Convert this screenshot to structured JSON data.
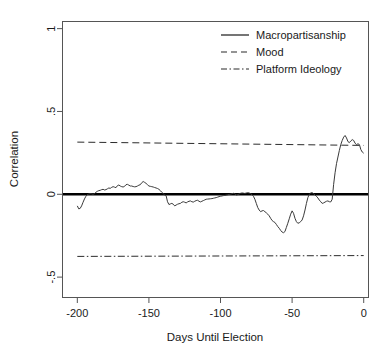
{
  "chart_data": {
    "type": "line",
    "title": "",
    "xlabel": "Days Until Election",
    "ylabel": "Correlation",
    "xlim": [
      -210,
      3
    ],
    "ylim": [
      -0.62,
      1.04
    ],
    "grid": false,
    "legend_position": "top-right",
    "xticks": [
      -200,
      -150,
      -100,
      -50,
      0
    ],
    "xticklabels": [
      "-200",
      "-150",
      "-100",
      "-50",
      "0"
    ],
    "yticks": [
      1,
      0.5,
      0,
      -0.5
    ],
    "yticklabels": [
      "1",
      ".5",
      "0",
      "-.5"
    ],
    "zero_reference_line": {
      "name": "zero-line",
      "y": 0,
      "style": "solid-thick"
    },
    "series": [
      {
        "name": "Macropartisanship",
        "style": "solid",
        "x": [
          -200,
          -198,
          -196,
          -194,
          -192,
          -190,
          -188,
          -186,
          -184,
          -182,
          -180,
          -178,
          -176,
          -174,
          -172,
          -170,
          -168,
          -166,
          -164,
          -162,
          -160,
          -158,
          -156,
          -154,
          -152,
          -150,
          -148,
          -146,
          -144,
          -142,
          -140,
          -138,
          -136,
          -134,
          -132,
          -130,
          -128,
          -126,
          -124,
          -122,
          -120,
          -118,
          -116,
          -114,
          -112,
          -110,
          -108,
          -106,
          -104,
          -102,
          -100,
          -98,
          -96,
          -94,
          -92,
          -90,
          -88,
          -86,
          -84,
          -82,
          -80,
          -78,
          -76,
          -74,
          -72,
          -70,
          -68,
          -66,
          -64,
          -62,
          -60,
          -58,
          -56,
          -54,
          -52,
          -50,
          -48,
          -46,
          -44,
          -42,
          -40,
          -38,
          -36,
          -34,
          -32,
          -30,
          -28,
          -26,
          -24,
          -22,
          -20,
          -18,
          -16,
          -14,
          -12,
          -10,
          -8,
          -6,
          -4,
          -2,
          0
        ],
        "y": [
          -0.075,
          -0.085,
          -0.06,
          -0.025,
          0.0,
          0.005,
          0.0,
          0.01,
          0.02,
          0.03,
          0.028,
          0.035,
          0.045,
          0.04,
          0.055,
          0.05,
          0.045,
          0.06,
          0.055,
          0.05,
          0.045,
          0.05,
          0.055,
          0.075,
          0.07,
          0.05,
          0.045,
          0.04,
          0.035,
          0.02,
          0.005,
          -0.005,
          -0.06,
          -0.055,
          -0.07,
          -0.06,
          -0.055,
          -0.045,
          -0.05,
          -0.04,
          -0.045,
          -0.04,
          -0.035,
          -0.045,
          -0.04,
          -0.03,
          -0.028,
          -0.025,
          -0.02,
          -0.015,
          -0.01,
          -0.008,
          -0.003,
          0.0,
          0.005,
          -0.005,
          0.003,
          0.008,
          0.005,
          0.01,
          0.005,
          -0.005,
          -0.03,
          -0.09,
          -0.105,
          -0.1,
          -0.11,
          -0.12,
          -0.155,
          -0.165,
          -0.18,
          -0.2,
          -0.225,
          -0.23,
          -0.19,
          -0.145,
          -0.1,
          -0.16,
          -0.175,
          -0.16,
          -0.08,
          -0.02,
          0.01,
          0.0,
          -0.015,
          -0.04,
          -0.055,
          -0.05,
          -0.04,
          -0.045,
          0.12,
          0.21,
          0.31,
          0.355,
          0.315,
          0.33,
          0.3,
          0.305,
          0.265,
          0.255,
          0.23
        ]
      },
      {
        "name": "Mood",
        "style": "dashed",
        "x": [
          -200,
          0
        ],
        "y": [
          0.315,
          0.295
        ]
      },
      {
        "name": "Platform Ideology",
        "style": "dashdot",
        "x": [
          -200,
          0
        ],
        "y": [
          -0.375,
          -0.37
        ]
      }
    ],
    "macropartisanship_detail": {
      "x": [
        -200,
        -199,
        -198,
        -197,
        -196,
        -195,
        -194,
        -193,
        -192,
        -191,
        -190,
        -189,
        -188,
        -187,
        -186,
        -185,
        -184,
        -183,
        -182,
        -181,
        -180,
        -179,
        -178,
        -177,
        -176,
        -175,
        -174,
        -173,
        -172,
        -171,
        -170,
        -169,
        -168,
        -167,
        -166,
        -165,
        -164,
        -163,
        -162,
        -161,
        -160,
        -159,
        -158,
        -157,
        -156,
        -155,
        -154,
        -153,
        -152,
        -151,
        -150,
        -149,
        -148,
        -147,
        -146,
        -145,
        -144,
        -143,
        -142,
        -141,
        -140,
        -139,
        -138,
        -137,
        -136,
        -135,
        -134,
        -133,
        -132,
        -131,
        -130,
        -129,
        -128,
        -127,
        -126,
        -125,
        -124,
        -123,
        -122,
        -121,
        -120,
        -119,
        -118,
        -117,
        -116,
        -115,
        -114,
        -113,
        -112,
        -111,
        -110,
        -109,
        -108,
        -107,
        -106,
        -105,
        -104,
        -103,
        -102,
        -101,
        -100,
        -99,
        -98,
        -97,
        -96,
        -95,
        -94,
        -93,
        -92,
        -91,
        -90,
        -89,
        -88,
        -87,
        -86,
        -85,
        -84,
        -83,
        -82,
        -81,
        -80,
        -79,
        -78,
        -77,
        -76,
        -75,
        -74,
        -73,
        -72,
        -71,
        -70,
        -69,
        -68,
        -67,
        -66,
        -65,
        -64,
        -63,
        -62,
        -61,
        -60,
        -59,
        -58,
        -57,
        -56,
        -55,
        -54,
        -53,
        -52,
        -51,
        -50,
        -49,
        -48,
        -47,
        -46,
        -45,
        -44,
        -43,
        -42,
        -41,
        -40,
        -39,
        -38,
        -37,
        -36,
        -35,
        -34,
        -33,
        -32,
        -31,
        -30,
        -29,
        -28,
        -27,
        -26,
        -25,
        -24,
        -23,
        -22,
        -21,
        -20,
        -19,
        -18,
        -17,
        -16,
        -15,
        -14,
        -13,
        -12,
        -11,
        -10,
        -9,
        -8,
        -7,
        -6,
        -5,
        -4,
        -3,
        -2,
        -1,
        0
      ],
      "y": [
        -0.07,
        -0.088,
        -0.085,
        -0.07,
        -0.048,
        -0.028,
        -0.012,
        -0.002,
        0.002,
        0.004,
        0.003,
        0.0,
        0.004,
        0.012,
        0.018,
        0.022,
        0.024,
        0.028,
        0.03,
        0.026,
        0.028,
        0.033,
        0.038,
        0.036,
        0.042,
        0.046,
        0.043,
        0.04,
        0.052,
        0.056,
        0.05,
        0.046,
        0.044,
        0.048,
        0.058,
        0.06,
        0.055,
        0.05,
        0.05,
        0.047,
        0.045,
        0.046,
        0.05,
        0.055,
        0.058,
        0.07,
        0.077,
        0.072,
        0.066,
        0.058,
        0.05,
        0.048,
        0.046,
        0.044,
        0.041,
        0.038,
        0.035,
        0.03,
        0.022,
        0.012,
        0.004,
        -0.004,
        -0.008,
        -0.045,
        -0.062,
        -0.058,
        -0.055,
        -0.06,
        -0.07,
        -0.065,
        -0.06,
        -0.057,
        -0.055,
        -0.048,
        -0.045,
        -0.048,
        -0.052,
        -0.046,
        -0.042,
        -0.04,
        -0.045,
        -0.047,
        -0.042,
        -0.038,
        -0.036,
        -0.042,
        -0.046,
        -0.042,
        -0.038,
        -0.034,
        -0.03,
        -0.029,
        -0.028,
        -0.027,
        -0.026,
        -0.024,
        -0.022,
        -0.02,
        -0.017,
        -0.014,
        -0.012,
        -0.01,
        -0.008,
        -0.007,
        -0.005,
        -0.003,
        -0.001,
        0.001,
        0.004,
        0.006,
        0.003,
        -0.004,
        -0.002,
        0.002,
        0.006,
        0.008,
        0.007,
        0.005,
        0.008,
        0.01,
        0.008,
        0.004,
        -0.002,
        -0.012,
        -0.03,
        -0.055,
        -0.08,
        -0.095,
        -0.105,
        -0.1,
        -0.098,
        -0.105,
        -0.112,
        -0.12,
        -0.13,
        -0.145,
        -0.158,
        -0.165,
        -0.17,
        -0.182,
        -0.195,
        -0.205,
        -0.218,
        -0.228,
        -0.232,
        -0.225,
        -0.2,
        -0.175,
        -0.148,
        -0.12,
        -0.1,
        -0.115,
        -0.145,
        -0.165,
        -0.175,
        -0.172,
        -0.165,
        -0.155,
        -0.13,
        -0.095,
        -0.055,
        -0.02,
        0.0,
        0.008,
        0.01,
        0.004,
        -0.005,
        -0.012,
        -0.022,
        -0.035,
        -0.045,
        -0.055,
        -0.052,
        -0.047,
        -0.042,
        -0.04,
        -0.045,
        -0.046,
        -0.03,
        0.06,
        0.13,
        0.185,
        0.225,
        0.265,
        0.3,
        0.325,
        0.345,
        0.355,
        0.34,
        0.318,
        0.312,
        0.322,
        0.33,
        0.325,
        0.308,
        0.3,
        0.305,
        0.3,
        0.27,
        0.255,
        0.248,
        0.258,
        0.3,
        0.345,
        0.37,
        0.355,
        0.345
      ]
    }
  },
  "axes": {
    "y_title": "Correlation",
    "x_title": "Days Until Election"
  },
  "legend": {
    "items": [
      {
        "label": "Macropartisanship",
        "style": "solid"
      },
      {
        "label": "Mood",
        "style": "dashed"
      },
      {
        "label": "Platform Ideology",
        "style": "dashdot"
      }
    ]
  }
}
